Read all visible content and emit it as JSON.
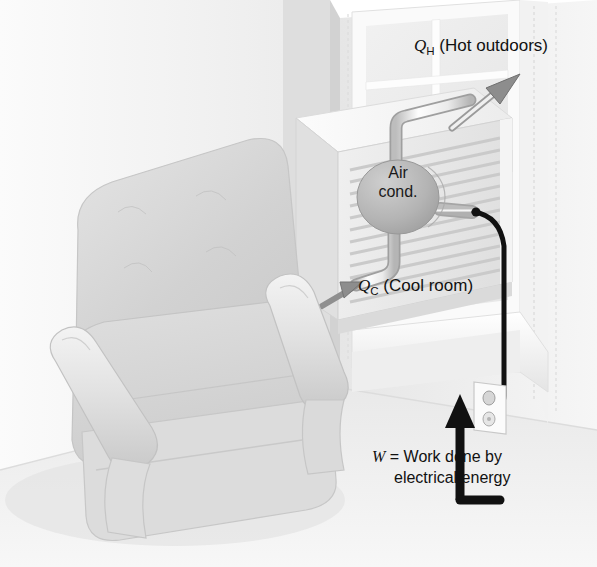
{
  "figure": {
    "type": "physics-illustration",
    "scene_elements": [
      "armchair",
      "room-wall",
      "window",
      "window-air-conditioner",
      "refrigerant-pipes",
      "power-cord",
      "wall-outlet",
      "floor"
    ]
  },
  "labels": {
    "q_hot": {
      "symbol": "Q",
      "subscript": "H",
      "text": "(Hot outdoors)"
    },
    "q_cold": {
      "symbol": "Q",
      "subscript": "C",
      "text": "(Cool room)"
    },
    "work": {
      "symbol": "W",
      "equals": "=",
      "line1": "Work done by",
      "line2": "electrical energy"
    },
    "air_conditioner": {
      "line1": "Air",
      "line2": "cond."
    }
  },
  "arrows": [
    {
      "name": "q-hot-arrow",
      "direction": "up-right",
      "meaning": "heat expelled to hot outdoors",
      "style": "outlined-gray"
    },
    {
      "name": "q-cold-arrow",
      "direction": "up-right",
      "meaning": "heat absorbed from cool room",
      "style": "solid-gray"
    },
    {
      "name": "work-arrow",
      "direction": "up",
      "meaning": "electrical work input along power cord",
      "style": "solid-black"
    }
  ],
  "colors": {
    "background": "#ffffff",
    "wall_light": "#f2f2f2",
    "wall_mid": "#e2e2e2",
    "wall_shadow": "#d5d5d5",
    "chair_light": "#e8e8e8",
    "chair_mid": "#d9d9d9",
    "chair_dark": "#c4c4c4",
    "ac_body": "#ededed",
    "ac_louver": "#dcdcdc",
    "ellipse_fill": "#b9b9b9",
    "pipe": "#f4f4f4",
    "cord": "#111111",
    "text": "#111111",
    "arrow_gray": "#8d8d8d"
  }
}
